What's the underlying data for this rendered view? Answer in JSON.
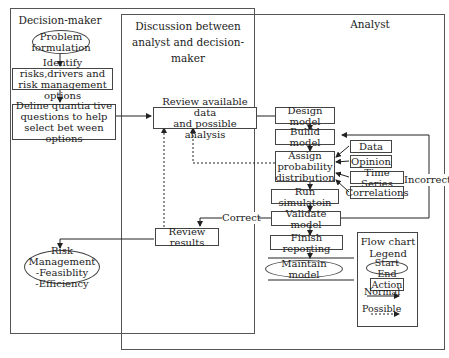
{
  "swimlanes": {
    "decision_maker": "Decision-maker",
    "discussion": "Discussion between\nanalyst and decision-maker",
    "analyst": "Analyst"
  },
  "nodes": {
    "problem_formulation": "Problem\nformulation",
    "identify_risks": "Identify risks,drivers and\nrisk management options",
    "define_questions": "Deline quantia tive\nquestions to help\nselect bet ween options",
    "risk_management": "Risk Management\n-Feasiblity\n-Efficiency",
    "review_data": "Review available data\nand possible analysis",
    "review_results": "Review results",
    "design_model": "Design model",
    "build_model": "Bulild model",
    "assign_prob": "Assign\nprobability\ndistribution",
    "run_simulation": "Run simulatoin",
    "validate_model": "Validate model",
    "finish_reporting": "Finish reporting",
    "maintain_model": "Maintain model",
    "data": "Data",
    "opinion": "Opinion",
    "time_series": "Time Series",
    "correlations": "Correlations"
  },
  "edge_labels": {
    "correct": "Correct",
    "incorrect": "Incorrect"
  },
  "legend": {
    "title": "Flow chart\nLegend",
    "start_end": "Start End",
    "action": "Action",
    "normal": "Normal",
    "possible": "Possible"
  }
}
